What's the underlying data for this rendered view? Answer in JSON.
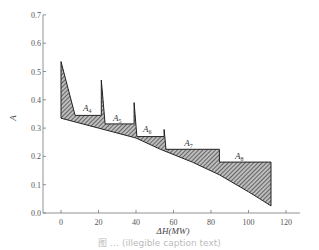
{
  "chart_data": {
    "type": "area",
    "title": "",
    "xlabel": "ΔH(MW)",
    "ylabel": "A",
    "xlim": [
      -10,
      130
    ],
    "ylim": [
      0.0,
      0.7
    ],
    "xticks": [
      0,
      20,
      40,
      60,
      80,
      100,
      120
    ],
    "yticks": [
      0.0,
      0.1,
      0.2,
      0.3,
      0.4,
      0.5,
      0.6,
      0.7
    ],
    "ytick_labels": [
      "0.0",
      "0.1",
      "0.2",
      "0.3",
      "0.4",
      "0.5",
      "0.6",
      "0.7"
    ],
    "grid": false,
    "legend": null,
    "series": [
      {
        "name": "upper step boundary",
        "x": [
          0,
          7.5,
          21.5,
          21.5,
          23.5,
          39,
          39,
          40.5,
          55,
          55,
          56,
          84.5,
          84.5,
          112
        ],
        "y": [
          0.535,
          0.345,
          0.345,
          0.47,
          0.315,
          0.315,
          0.39,
          0.27,
          0.27,
          0.295,
          0.225,
          0.225,
          0.18,
          0.18
        ]
      },
      {
        "name": "lower curve",
        "x": [
          0,
          20,
          40,
          53,
          70,
          84.5,
          100,
          106,
          112
        ],
        "y": [
          0.335,
          0.3,
          0.265,
          0.225,
          0.18,
          0.135,
          0.075,
          0.05,
          0.025
        ]
      }
    ],
    "annotations": [
      {
        "text": "A",
        "sub": "4",
        "x": 14,
        "y": 0.36
      },
      {
        "text": "A",
        "sub": "5",
        "x": 30,
        "y": 0.325
      },
      {
        "text": "A",
        "sub": "6",
        "x": 46,
        "y": 0.285
      },
      {
        "text": "A",
        "sub": "7",
        "x": 68,
        "y": 0.235
      },
      {
        "text": "A",
        "sub": "8",
        "x": 95,
        "y": 0.19
      }
    ],
    "fill": "hatched region between upper step boundary and lower curve"
  },
  "caption": "图 … (illegible caption text)",
  "colors": {
    "line": "#222222",
    "axis": "#666666",
    "hatch": "#333333"
  }
}
